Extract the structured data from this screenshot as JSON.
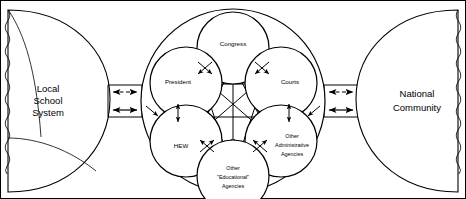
{
  "figure": {
    "background_color": "#ffffff",
    "line_color": "#000000",
    "border": "thin black rectangular frame"
  },
  "left_region": {
    "name": "local-school-system",
    "label_lines": [
      "Local",
      "School",
      "System"
    ],
    "shape": "half-circle bulging right with wavy left edge and internal curved division lines"
  },
  "right_region": {
    "name": "national-community",
    "label_lines": [
      "National",
      "Community"
    ],
    "shape": "half-circle bulging left with wavy right edge"
  },
  "center_region": {
    "name": "federal-policy-arena",
    "shape": "large circle enclosing five overlapping circles",
    "nodes": [
      {
        "id": "congress",
        "label_lines": [
          "Congress"
        ],
        "position": "top"
      },
      {
        "id": "president",
        "label_lines": [
          "President"
        ],
        "position": "upper-left"
      },
      {
        "id": "courts",
        "label_lines": [
          "Courts"
        ],
        "position": "upper-right"
      },
      {
        "id": "hew",
        "label_lines": [
          "HEW"
        ],
        "position": "lower-left"
      },
      {
        "id": "other-administrative-agencies",
        "label_lines": [
          "Other",
          "Administrative",
          "Agencies"
        ],
        "position": "lower-right"
      },
      {
        "id": "other-educational-agencies",
        "label_lines": [
          "Other",
          "\"Educational\"",
          "Agencies"
        ],
        "position": "bottom-center"
      }
    ],
    "internal_links": "double-headed arrows interconnecting every pair of inner circles"
  },
  "connectors": {
    "left": {
      "name": "left-connector-channel",
      "upper_arrow": {
        "style": "dashed",
        "heads": "both"
      },
      "lower_arrow": {
        "style": "solid",
        "heads": "both"
      }
    },
    "right": {
      "name": "right-connector-channel",
      "upper_arrow": {
        "style": "dashed",
        "heads": "both"
      },
      "lower_arrow": {
        "style": "solid",
        "heads": "both"
      }
    }
  }
}
